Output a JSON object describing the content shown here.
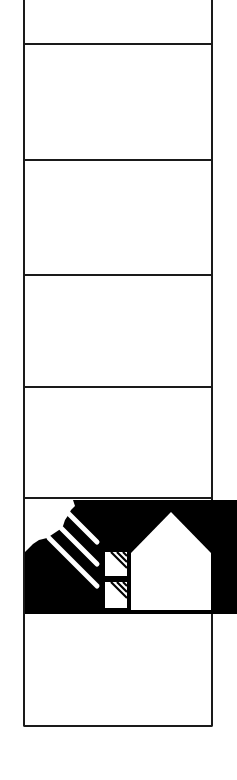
{
  "figure": {
    "type": "column-diagram",
    "colors": {
      "line": "#1a1a1a",
      "banner": "#000000",
      "background": "#ffffff"
    },
    "cells": [
      {
        "index": 0,
        "top": 0,
        "bottom": 44,
        "fill": "empty"
      },
      {
        "index": 1,
        "top": 44,
        "bottom": 160,
        "fill": "empty"
      },
      {
        "index": 2,
        "top": 160,
        "bottom": 275,
        "fill": "empty"
      },
      {
        "index": 3,
        "top": 275,
        "bottom": 387,
        "fill": "empty"
      },
      {
        "index": 4,
        "top": 387,
        "bottom": 498,
        "fill": "empty"
      },
      {
        "index": 5,
        "top": 498,
        "bottom": 614,
        "fill": "black-banner"
      },
      {
        "index": 6,
        "top": 614,
        "bottom": 725,
        "fill": "empty"
      }
    ],
    "banner_icons": [
      {
        "name": "sun-icon",
        "meaning": "sun in top-left corner"
      },
      {
        "name": "sun-rays-icon",
        "meaning": "three diagonal rays"
      },
      {
        "name": "window-icon",
        "meaning": "two hatched glazing panes"
      },
      {
        "name": "house-icon",
        "meaning": "house silhouette"
      }
    ]
  }
}
